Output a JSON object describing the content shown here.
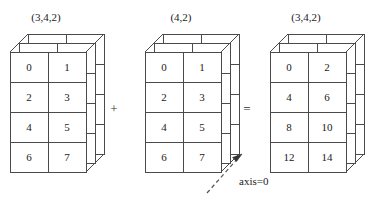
{
  "figure": {
    "background_color": "#ffffff",
    "stroke_color": "#4a4a4a",
    "text_color": "#1a1a1a"
  },
  "blocks": [
    {
      "id": "left-operand",
      "shape_label": "(3,4,2)",
      "depth_layers": 3,
      "rows": 4,
      "cols": 2,
      "values": [
        [
          "0",
          "1"
        ],
        [
          "2",
          "3"
        ],
        [
          "4",
          "5"
        ],
        [
          "6",
          "7"
        ]
      ]
    },
    {
      "id": "right-operand",
      "shape_label": "(4,2)",
      "depth_layers": 3,
      "rows": 4,
      "cols": 2,
      "values": [
        [
          "0",
          "1"
        ],
        [
          "2",
          "3"
        ],
        [
          "4",
          "5"
        ],
        [
          "6",
          "7"
        ]
      ]
    },
    {
      "id": "result",
      "shape_label": "(3,4,2)",
      "depth_layers": 3,
      "rows": 4,
      "cols": 2,
      "values": [
        [
          "0",
          "2"
        ],
        [
          "4",
          "6"
        ],
        [
          "8",
          "10"
        ],
        [
          "12",
          "14"
        ]
      ]
    }
  ],
  "operators": {
    "plus": "+",
    "equals": "="
  },
  "annotation": {
    "axis_label": "axis=0",
    "arrow_style": "dashed-arrow-up-right"
  }
}
